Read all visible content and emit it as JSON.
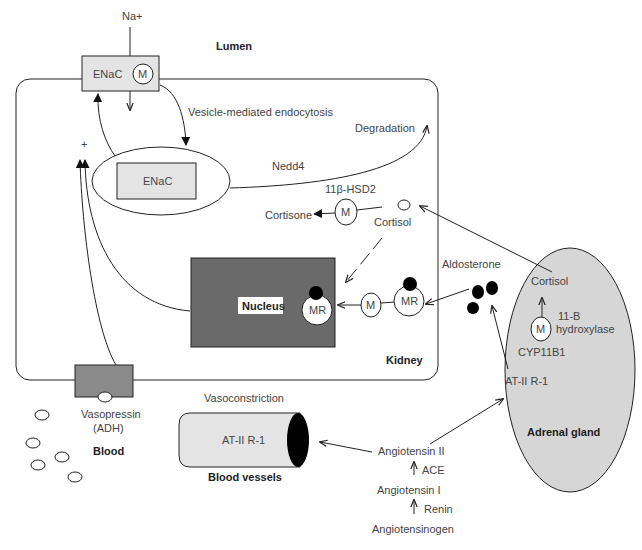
{
  "diagram": {
    "regions": {
      "lumen": "Lumen",
      "kidney": "Kidney",
      "blood": "Blood",
      "blood_vessels": "Blood vessels",
      "adrenal_gland": "Adrenal gland"
    },
    "ions": {
      "sodium": "Na+"
    },
    "channel_membrane": {
      "label": "ENaC",
      "modifier": "M"
    },
    "channel_vesicle": {
      "label": "ENaC"
    },
    "processes": {
      "endocytosis": "Vesicle-mediated endocytosis",
      "degradation": "Degradation",
      "nedd4": "Nedd4",
      "enzyme_11b_hsd2": "11β-HSD2",
      "vasoconstriction": "Vasoconstriction",
      "plus_sign": "+"
    },
    "molecules": {
      "cortisone": "Cortisone",
      "cortisol_kidney": "Cortisol",
      "cortisol_adrenal": "Cortisol",
      "aldosterone": "Aldosterone",
      "vasopressin_line1": "Vasopressin",
      "vasopressin_line2": "(ADH)"
    },
    "nucleus": {
      "label": "Nucleus",
      "receptor": "MR"
    },
    "cytoplasm_complex": {
      "modifier": "M",
      "receptor": "MR"
    },
    "hsd2_modifier": "M",
    "adrenal": {
      "modifier": "M",
      "enzyme_line1": "11-B",
      "enzyme_line2": "hydroxylase",
      "gene": "CYP11B1",
      "receptor": "AT-II R-1"
    },
    "vessel": {
      "receptor": "AT-II R-1"
    },
    "raas_cascade": {
      "angiotensinogen": "Angiotensinogen",
      "renin": "Renin",
      "angiotensin_1": "Angiotensin I",
      "ace": "ACE",
      "angiotensin_2": "Angiotensin II"
    },
    "colors": {
      "light_fill": "#e4e4e4",
      "nucleus_fill": "#6a6a6a",
      "channel_fill": "#8a8a8a",
      "adrenal_fill": "#d6d6d6",
      "ligand_fill": "#000000",
      "line": "#222222"
    }
  }
}
